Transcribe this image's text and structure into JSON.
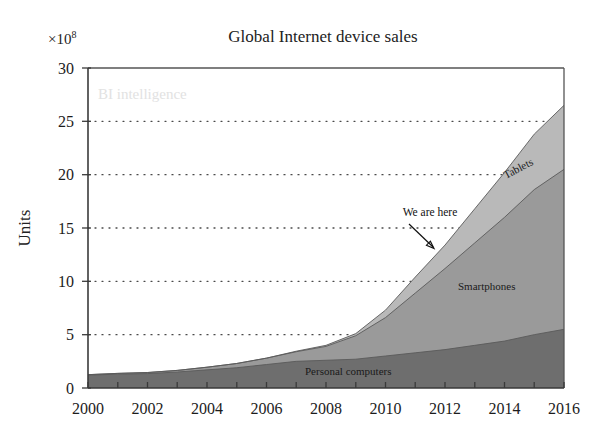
{
  "chart_data": {
    "type": "area",
    "title": "Global Internet device sales",
    "subtitle": "",
    "xlabel": "",
    "ylabel": "Units",
    "y_multiplier": "×10",
    "y_multiplier_exponent": "8",
    "xlim": [
      2000,
      2016
    ],
    "ylim": [
      0,
      30
    ],
    "grid": true,
    "legend_position": "inline-labels",
    "x": [
      2000,
      2001,
      2002,
      2003,
      2004,
      2005,
      2006,
      2007,
      2008,
      2009,
      2010,
      2011,
      2012,
      2013,
      2014,
      2015,
      2016
    ],
    "xticks": [
      2000,
      2002,
      2004,
      2006,
      2008,
      2010,
      2012,
      2014,
      2016
    ],
    "xtick_labels": [
      "2000",
      "2002",
      "2004",
      "2006",
      "2008",
      "2010",
      "2012",
      "2014",
      "2016"
    ],
    "yticks": [
      0,
      5,
      10,
      15,
      20,
      25,
      30
    ],
    "ytick_labels": [
      "0",
      "5",
      "10",
      "15",
      "20",
      "25",
      "30"
    ],
    "stacked": true,
    "series": [
      {
        "name": "Personal computers",
        "color": "#6e6e6e",
        "values": [
          1.2,
          1.3,
          1.35,
          1.5,
          1.7,
          1.9,
          2.2,
          2.5,
          2.6,
          2.7,
          3.0,
          3.3,
          3.6,
          4.0,
          4.4,
          5.0,
          5.5
        ]
      },
      {
        "name": "Smartphones",
        "color": "#9a9a9a",
        "values": [
          0.05,
          0.07,
          0.1,
          0.15,
          0.25,
          0.4,
          0.6,
          0.9,
          1.3,
          2.2,
          3.6,
          5.6,
          7.6,
          9.6,
          11.6,
          13.6,
          15.0
        ]
      },
      {
        "name": "Tablets",
        "color": "#b9b9b9",
        "values": [
          0.0,
          0.0,
          0.0,
          0.0,
          0.0,
          0.0,
          0.0,
          0.05,
          0.1,
          0.2,
          0.7,
          1.5,
          2.2,
          3.2,
          4.2,
          5.2,
          6.0
        ]
      }
    ],
    "annotations": [
      {
        "text": "We are here",
        "x": 2012,
        "y": 13.0,
        "arrow": true
      }
    ],
    "watermark": "BI intelligence"
  },
  "series_labels": {
    "tablets": "Tablets",
    "smartphones": "Smartphones",
    "personal_computers": "Personal computers"
  },
  "annotation": {
    "we_are_here": "We are here"
  }
}
